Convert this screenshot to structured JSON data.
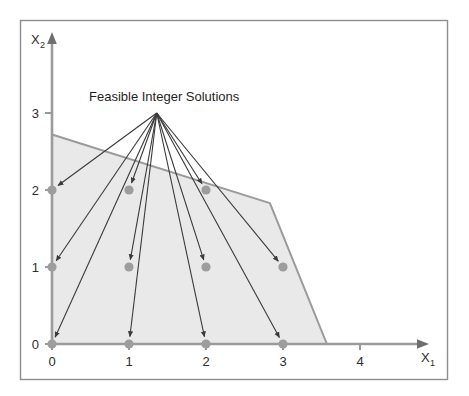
{
  "figure": {
    "annotation_label": "Feasible Integer Solutions",
    "xlabel_base": "X",
    "xlabel_sub": "1",
    "ylabel_base": "X",
    "ylabel_sub": "2",
    "colors": {
      "region_fill": "#e9e9e9",
      "region_stroke": "#9a9a9a",
      "axis": "#9a9a9a",
      "point": "#9d9d9d",
      "arrow": "#3a3a3a",
      "frame": "#8d8d8d",
      "text": "#1f1f1f"
    }
  },
  "chart_data": {
    "type": "scatter",
    "title": "Feasible Integer Solutions",
    "xlabel": "X1",
    "ylabel": "X2",
    "xlim": [
      0,
      4.6
    ],
    "ylim": [
      0,
      3.4
    ],
    "xticks": [
      "0",
      "1",
      "2",
      "3",
      "4"
    ],
    "xtick_values": [
      0,
      1,
      2,
      3,
      4
    ],
    "yticks": [
      "0",
      "1",
      "2",
      "3"
    ],
    "ytick_values": [
      0,
      1,
      2,
      3
    ],
    "grid": false,
    "legend": "none",
    "feasible_region": {
      "name": "Feasible Region (LP relaxation)",
      "fill": "#e9e9e9",
      "vertices": [
        [
          0,
          0
        ],
        [
          0,
          2.72
        ],
        [
          2.83,
          1.83
        ],
        [
          3.57,
          0
        ]
      ]
    },
    "series": [
      {
        "name": "Feasible Integer Solutions",
        "marker": "circle",
        "color": "#9d9d9d",
        "points": [
          [
            0,
            0
          ],
          [
            1,
            0
          ],
          [
            2,
            0
          ],
          [
            3,
            0
          ],
          [
            0,
            1
          ],
          [
            1,
            1
          ],
          [
            2,
            1
          ],
          [
            3,
            1
          ],
          [
            0,
            2
          ],
          [
            1,
            2
          ],
          [
            2,
            2
          ]
        ]
      }
    ],
    "annotations": [
      {
        "text": "Feasible Integer Solutions",
        "anchor_x": 1.36,
        "anchor_y": 3.0,
        "arrow_targets": [
          [
            0,
            0
          ],
          [
            1,
            0
          ],
          [
            2,
            0
          ],
          [
            3,
            0
          ],
          [
            0,
            1
          ],
          [
            1,
            1
          ],
          [
            2,
            1
          ],
          [
            3,
            1
          ],
          [
            0,
            2
          ],
          [
            1,
            2
          ],
          [
            2,
            2
          ]
        ]
      }
    ]
  }
}
